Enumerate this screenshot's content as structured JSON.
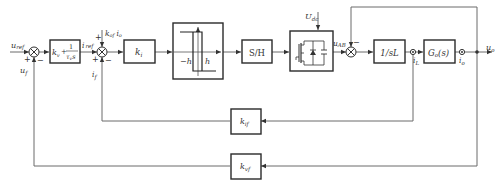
{
  "diagram": {
    "type": "control-block-diagram",
    "signals": {
      "u_ref": "u_ref",
      "u_f": "u_f",
      "i_ref": "i_ref",
      "i_f": "i_f",
      "kof_io": "k_of i_o",
      "U_dc": "U_dc",
      "u_AB": "u_AB",
      "i_L": "i_L",
      "i_o": "i_o",
      "u_o": "u_o"
    },
    "blocks": {
      "pi_controller": {
        "kv": "k",
        "kv_sub": "v",
        "plus": "+",
        "num": "1",
        "den_tau": "τ",
        "den_sub": "v",
        "den_s": "s"
      },
      "ki": {
        "main": "k",
        "sub": "i"
      },
      "hysteresis": {
        "neg_h": "−h",
        "pos_h": "h"
      },
      "sample_hold": {
        "label": "S/H"
      },
      "inverter": {
        "label": "inverter-bridge"
      },
      "inductor": {
        "label": "1/sL"
      },
      "load": {
        "main": "G",
        "sub": "o",
        "arg": "(s)"
      },
      "kif": {
        "main": "k",
        "sub": "if"
      },
      "kvf": {
        "main": "k",
        "sub": "vf"
      }
    },
    "summing_junctions": [
      {
        "id": "sum1",
        "signs": [
          "+",
          "−"
        ]
      },
      {
        "id": "sum2",
        "signs": [
          "+",
          "+",
          "−"
        ]
      },
      {
        "id": "sum3",
        "signs": [
          "−"
        ]
      }
    ],
    "labels": {
      "u": "u",
      "ref": "ref",
      "f": "f",
      "i": "i",
      "kof_k": "k",
      "kof_sub": "of",
      "kof_i": "i",
      "kof_isub": "o",
      "Udc_U": "U",
      "Udc_sub": "dc",
      "uAB_u": "u",
      "uAB_sub": "AB",
      "iL_i": "i",
      "iL_sub": "L",
      "io_i": "i",
      "io_sub": "o",
      "uo_u": "u",
      "uo_sub": "o",
      "plus": "+",
      "minus": "−"
    }
  }
}
